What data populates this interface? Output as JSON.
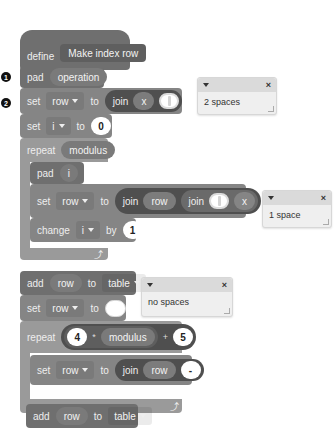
{
  "script": {
    "define": {
      "keyword": "define",
      "name": "Make index row"
    },
    "markers": [
      "1",
      "2"
    ],
    "pad1": {
      "keyword": "pad",
      "arg": "operation"
    },
    "set_row1": {
      "keyword": "set",
      "var": "row",
      "to": "to",
      "join": "join",
      "arg1": "x",
      "arg2_hint": "cursor"
    },
    "set_i": {
      "keyword": "set",
      "var": "i",
      "to": "to",
      "value": "0"
    },
    "repeat1": {
      "keyword": "repeat",
      "count": "modulus"
    },
    "pad2": {
      "keyword": "pad",
      "arg": "i"
    },
    "set_row2": {
      "keyword": "set",
      "var": "row",
      "to": "to",
      "join": "join",
      "arg1": "row",
      "join2": "join",
      "arg3": "x"
    },
    "change_i": {
      "keyword": "change",
      "var": "i",
      "by": "by",
      "value": "1"
    },
    "loop_arrow": "⤴",
    "add1": {
      "keyword": "add",
      "item": "row",
      "to": "to",
      "list": "table"
    },
    "set_row3": {
      "keyword": "set",
      "var": "row",
      "to": "to"
    },
    "repeat2": {
      "keyword": "repeat",
      "a": "4",
      "times": "*",
      "b": "modulus",
      "plus": "+",
      "c": "5"
    },
    "set_row4": {
      "keyword": "set",
      "var": "row",
      "to": "to",
      "join": "join",
      "arg1": "row",
      "arg2": "-"
    },
    "add2": {
      "keyword": "add",
      "item": "row",
      "to": "to",
      "list": "table"
    }
  },
  "comments": [
    {
      "text": "2 spaces",
      "close": "×"
    },
    {
      "text": "1 space",
      "close": "×"
    },
    {
      "text": "no spaces",
      "close": "×"
    }
  ]
}
